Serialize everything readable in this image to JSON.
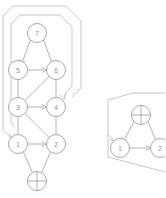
{
  "figure": {
    "background_color": "#ffffff",
    "line_color": "#a9a9a9",
    "region_color": "#bdbdbd",
    "node_stroke_color": "#9e9e9e",
    "label_color": "#8a8a8a"
  },
  "left_graph": {
    "name": "left-graph",
    "nodes": [
      {
        "id": "L7",
        "label": "7",
        "kind": "numbered",
        "x": 37,
        "y": 33,
        "r": 9.5
      },
      {
        "id": "L5",
        "label": "5",
        "kind": "numbered",
        "x": 18,
        "y": 70,
        "r": 9.5
      },
      {
        "id": "L6",
        "label": "6",
        "kind": "numbered",
        "x": 56,
        "y": 70,
        "r": 9.5
      },
      {
        "id": "L3",
        "label": "3",
        "kind": "numbered",
        "x": 18,
        "y": 107,
        "r": 9.5
      },
      {
        "id": "L4",
        "label": "4",
        "kind": "numbered",
        "x": 56,
        "y": 107,
        "r": 9.5
      },
      {
        "id": "L1",
        "label": "1",
        "kind": "numbered",
        "x": 18,
        "y": 144,
        "r": 9.5
      },
      {
        "id": "L2",
        "label": "2",
        "kind": "numbered",
        "x": 56,
        "y": 144,
        "r": 9.5
      },
      {
        "id": "Lbot",
        "label": "",
        "kind": "crossed",
        "x": 37,
        "y": 181,
        "r": 9.5
      }
    ],
    "edges": [
      {
        "from": "L7",
        "to": "L5",
        "arrow": true
      },
      {
        "from": "L7",
        "to": "L6",
        "arrow": false
      },
      {
        "from": "L5",
        "to": "L6",
        "arrow": true
      },
      {
        "from": "L5",
        "to": "L3",
        "arrow": false
      },
      {
        "from": "L6",
        "to": "L4",
        "arrow": false
      },
      {
        "from": "L3",
        "to": "L6",
        "arrow": false
      },
      {
        "from": "L3",
        "to": "L4",
        "arrow": true
      },
      {
        "from": "L3",
        "to": "L1",
        "arrow": false
      },
      {
        "from": "L3",
        "to": "L2",
        "arrow": false
      },
      {
        "from": "L4",
        "to": "L2",
        "arrow": false
      },
      {
        "from": "L1",
        "to": "L2",
        "arrow": true
      },
      {
        "from": "L1",
        "to": "Lbot",
        "arrow": false
      },
      {
        "from": "L2",
        "to": "Lbot",
        "arrow": false
      }
    ],
    "regions": [
      {
        "name": "outer-region",
        "target_node": "L1"
      },
      {
        "name": "inner-region",
        "target_node": "L4"
      }
    ]
  },
  "right_graph": {
    "name": "right-graph",
    "nodes": [
      {
        "id": "Rtop",
        "label": "",
        "kind": "crossed",
        "x": 141,
        "y": 115,
        "r": 9.5
      },
      {
        "id": "R1",
        "label": "1",
        "kind": "numbered",
        "x": 120,
        "y": 148,
        "r": 9.5
      },
      {
        "id": "R2",
        "label": "2",
        "kind": "numbered",
        "x": 160,
        "y": 148,
        "r": 9.5
      }
    ],
    "edges": [
      {
        "from": "Rtop",
        "to": "R1",
        "arrow": true
      },
      {
        "from": "Rtop",
        "to": "R2",
        "arrow": false
      },
      {
        "from": "R1",
        "to": "R2",
        "arrow": true
      }
    ],
    "regions": [
      {
        "name": "right-region",
        "target_node": "R1"
      }
    ]
  }
}
